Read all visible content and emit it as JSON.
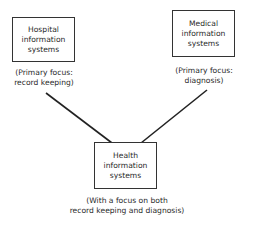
{
  "nodes": {
    "hospital": {
      "label_lines": [
        "Hospital",
        "information",
        "systems"
      ],
      "caption_lines": [
        "(Primary focus:",
        "record keeping)"
      ]
    },
    "medical": {
      "label_lines": [
        "Medical",
        "information",
        "systems"
      ],
      "caption_lines": [
        "(Primary focus:",
        "diagnosis)"
      ]
    },
    "health": {
      "label_lines": [
        "Health",
        "information",
        "systems"
      ],
      "caption_lines": [
        "(With a focus on both",
        "record keeping and diagnosis)"
      ]
    }
  },
  "edges": [
    {
      "from": "hospital",
      "to": "health"
    },
    {
      "from": "medical",
      "to": "health"
    }
  ],
  "colors": {
    "line": "#222222",
    "border": "#333333",
    "text": "#2a2a2a"
  }
}
